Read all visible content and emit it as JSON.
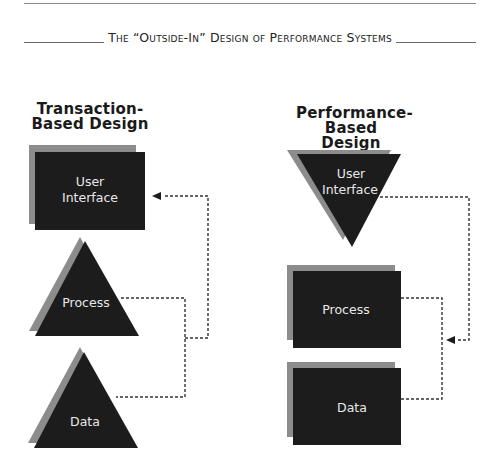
{
  "header": {
    "title": "The “Outside-In” Design of Performance Systems"
  },
  "left_column": {
    "heading_line1": "Transaction-",
    "heading_line2": "Based Design",
    "layers": [
      {
        "label_line1": "User",
        "label_line2": "Interface",
        "shape": "rectangle"
      },
      {
        "label": "Process",
        "shape": "triangle"
      },
      {
        "label": "Data",
        "shape": "triangle"
      }
    ]
  },
  "right_column": {
    "heading_line1": "Performance-",
    "heading_line2": "Based Design",
    "layers": [
      {
        "label_line1": "User",
        "label_line2": "Interface",
        "shape": "inverted-triangle"
      },
      {
        "label": "Process",
        "shape": "rectangle"
      },
      {
        "label": "Data",
        "shape": "rectangle"
      }
    ]
  },
  "colors": {
    "shape_fill": "#1c1c1c",
    "shadow_fill": "#8c8c8c",
    "connector": "#333333"
  }
}
